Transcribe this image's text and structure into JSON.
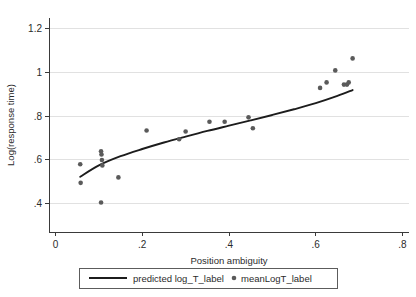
{
  "chart_data": {
    "type": "scatter",
    "title": "",
    "xlabel": "Position ambiguity",
    "ylabel": "Log(response time)",
    "xlim": [
      -0.015,
      0.815
    ],
    "ylim": [
      0.27,
      1.25
    ],
    "xticks": [
      0,
      0.2,
      0.4,
      0.6,
      0.8
    ],
    "xticklabels": [
      "0",
      ".2",
      ".4",
      ".6",
      ".8"
    ],
    "yticks": [
      0.4,
      0.6,
      0.8,
      1.0,
      1.2
    ],
    "yticklabels": [
      ".4",
      ".6",
      ".8",
      "1",
      "1.2"
    ],
    "grid": "horizontal",
    "legend_position": "below-axes",
    "series": [
      {
        "name": "predicted log_T_label",
        "type": "line",
        "color": "#1c1c1c",
        "x": [
          0.057,
          0.1,
          0.15,
          0.2,
          0.25,
          0.3,
          0.35,
          0.4,
          0.45,
          0.5,
          0.55,
          0.6,
          0.65,
          0.685
        ],
        "y": [
          0.523,
          0.575,
          0.617,
          0.65,
          0.68,
          0.707,
          0.733,
          0.757,
          0.781,
          0.806,
          0.832,
          0.86,
          0.893,
          0.92
        ]
      },
      {
        "name": "meanLogT_label",
        "type": "scatter",
        "color": "#5a5a5a",
        "x": [
          0.057,
          0.058,
          0.105,
          0.105,
          0.106,
          0.107,
          0.108,
          0.145,
          0.21,
          0.285,
          0.3,
          0.355,
          0.39,
          0.445,
          0.455,
          0.61,
          0.625,
          0.645,
          0.665,
          0.672,
          0.676,
          0.685
        ],
        "y": [
          0.58,
          0.495,
          0.405,
          0.64,
          0.625,
          0.6,
          0.575,
          0.52,
          0.735,
          0.695,
          0.73,
          0.775,
          0.775,
          0.795,
          0.745,
          0.93,
          0.955,
          1.01,
          0.945,
          0.945,
          0.955,
          1.065
        ]
      }
    ]
  },
  "legend": {
    "line_entry_label": "predicted log_T_label",
    "marker_entry_label": "meanLogT_label"
  },
  "colors": {
    "marker": "#5a5a5a",
    "line": "#1c1c1c",
    "grid": "#d9d9d9",
    "axis": "#3a3a3a",
    "background": "#ffffff"
  }
}
